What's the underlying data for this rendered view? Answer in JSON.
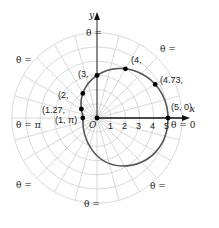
{
  "chart_data": {
    "type": "line",
    "title": "",
    "coordinate_system": "polar",
    "xlabel": "x",
    "ylabel": "y",
    "pole_label": "O",
    "radial_ticks": [
      "1",
      "2",
      "3",
      "4",
      "5"
    ],
    "grid": true,
    "grid_circles": 6,
    "grid_rays_deg": 15,
    "labeled_points": [
      {
        "label": "(5, 0)",
        "r": 5,
        "theta": "0"
      },
      {
        "label": "(4.73, π/6)",
        "r": 4.73,
        "theta": "π/6"
      },
      {
        "label": "(4, π/3)",
        "r": 4,
        "theta": "π/3"
      },
      {
        "label": "(3, π/2)",
        "r": 3,
        "theta": "π/2"
      },
      {
        "label": "(2, 2π/3)",
        "r": 2,
        "theta": "2π/3"
      },
      {
        "label": "(1.27, 5π/6)",
        "r": 1.27,
        "theta": "5π/6"
      },
      {
        "label": "(1, π)",
        "r": 1,
        "theta": "π"
      }
    ],
    "angle_labels": [
      {
        "text": "θ = 0"
      },
      {
        "text": "θ = π/4"
      },
      {
        "text": "θ = π/2"
      },
      {
        "text": "θ = 3π/4"
      },
      {
        "text": "θ = π"
      },
      {
        "text": "θ = 5π/4"
      },
      {
        "text": "θ = 3π/2"
      },
      {
        "text": "θ = 7π/4"
      }
    ]
  },
  "labels": {
    "x_axis": "x",
    "y_axis": "y",
    "pole": "O",
    "ticks": [
      "1",
      "2",
      "3",
      "4",
      "5"
    ],
    "theta_eq": "θ =",
    "theta0": "0",
    "pi": "π",
    "points": {
      "p0": "(5, 0)",
      "p1_r": "(4.73,",
      "p2_r": "(4,",
      "p3_r": "(3,",
      "p4_r": "(2,",
      "p5_r": "(1.27,",
      "p6": "(1, π)"
    }
  }
}
